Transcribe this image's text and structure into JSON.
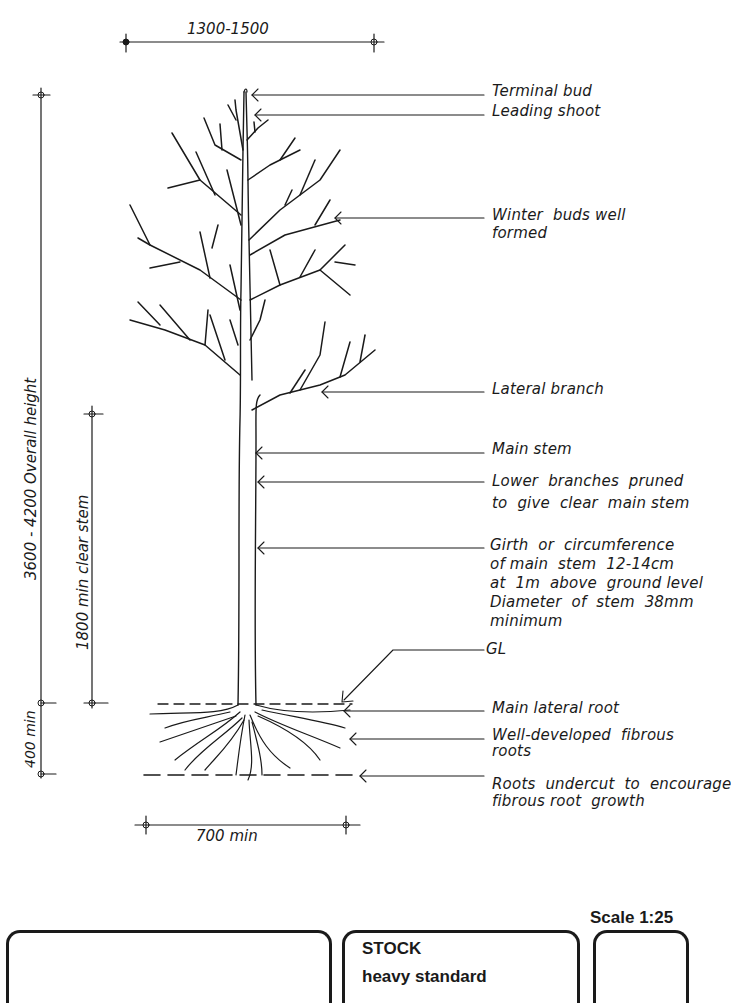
{
  "dimensions": {
    "crown_width": "1300-1500",
    "overall_height": "3600 - 4200  Overall  height",
    "clear_stem": "1800  min  clear  stem",
    "root_depth": "400 min",
    "root_spread": "700 min"
  },
  "labels": [
    {
      "id": "terminal-bud",
      "text": "Terminal  bud"
    },
    {
      "id": "leading-shoot",
      "text": "Leading  shoot"
    },
    {
      "id": "winter-buds",
      "text": "Winter  buds well\nformed"
    },
    {
      "id": "lateral-branch",
      "text": "Lateral  branch"
    },
    {
      "id": "main-stem",
      "text": "Main  stem"
    },
    {
      "id": "lower-branches",
      "text": "Lower  branches  pruned\nto  give  clear  main stem"
    },
    {
      "id": "girth",
      "text": "Girth  or  circumference\nof main  stem  12-14cm\nat  1m  above  ground level\nDiameter  of  stem  38mm\nminimum"
    },
    {
      "id": "gl",
      "text": "GL"
    },
    {
      "id": "main-lateral-root",
      "text": "Main  lateral  root"
    },
    {
      "id": "fibrous-roots",
      "text": "Well-developed  fibrous\nroots"
    },
    {
      "id": "roots-undercut",
      "text": "Roots  undercut  to  encourage\nfibrous root  growth"
    }
  ],
  "title_block": {
    "scale": "Scale 1:25",
    "stock_heading": "STOCK",
    "stock_value": "heavy  standard",
    "left_box_text": "",
    "right_box_text": ""
  }
}
